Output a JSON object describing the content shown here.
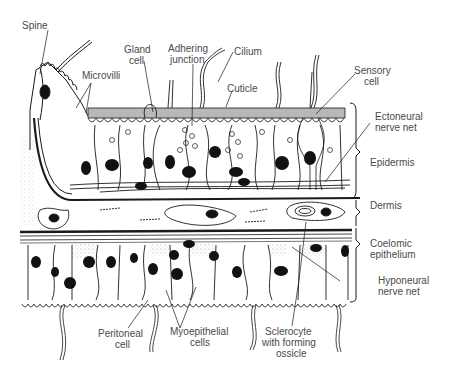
{
  "diagram": {
    "labels": {
      "spine": "Spine",
      "microvilli": "Microvilli",
      "gland_cell_1": "Gland",
      "gland_cell_2": "cell",
      "adhering_junction_1": "Adhering",
      "adhering_junction_2": "junction",
      "cilium": "Cilium",
      "cuticle": "Cuticle",
      "sensory_cell_1": "Sensory",
      "sensory_cell_2": "cell",
      "ectoneural_1": "Ectoneural",
      "ectoneural_2": "nerve net",
      "epidermis": "Epidermis",
      "dermis": "Dermis",
      "coelomic_1": "Coelomic",
      "coelomic_2": "epithelium",
      "hyponeural_1": "Hyponeural",
      "hyponeural_2": "nerve net",
      "peritoneal_1": "Peritoneal",
      "peritoneal_2": "cell",
      "myoepithelial_1": "Myoepithelial",
      "myoepithelial_2": "cells",
      "sclerocyte_1": "Sclerocyte",
      "sclerocyte_2": "with forming",
      "sclerocyte_3": "ossicle"
    },
    "colors": {
      "ink": "#1a1a1a",
      "label": "#4a4a4a",
      "cuticle_fill": "#b8b8b8",
      "nucleus": "#111111"
    }
  }
}
